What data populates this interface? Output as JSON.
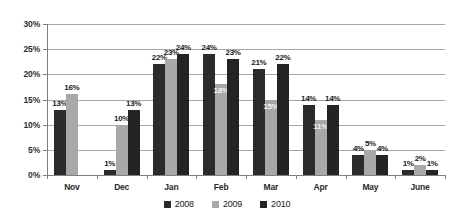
{
  "chart_data": {
    "type": "bar",
    "title": "",
    "subtitle": "",
    "xlabel": "",
    "ylabel": "",
    "categories": [
      "Nov",
      "Dec",
      "Jan",
      "Feb",
      "Mar",
      "Apr",
      "May",
      "June"
    ],
    "series": [
      {
        "name": "2008",
        "color": "#2b2b2b",
        "values": [
          13,
          1,
          22,
          24,
          21,
          14,
          4,
          1
        ],
        "labels": [
          "13%",
          "1%",
          "22%",
          "24%",
          "21%",
          "14%",
          "4%",
          "1%"
        ]
      },
      {
        "name": "2009",
        "color": "#a8a8a8",
        "values": [
          16,
          10,
          23,
          18,
          15,
          11,
          5,
          2
        ],
        "labels": [
          "16%",
          "10%",
          "23%",
          "18%",
          "15%",
          "11%",
          "5%",
          "2%"
        ]
      },
      {
        "name": "2010",
        "color": "#242424",
        "values": [
          null,
          13,
          24,
          23,
          22,
          14,
          4,
          1
        ],
        "labels": [
          "",
          "13%",
          "24%",
          "23%",
          "22%",
          "14%",
          "4%",
          "1%"
        ]
      }
    ],
    "ylim": [
      0,
      30
    ],
    "yticks": [
      0,
      5,
      10,
      15,
      20,
      25,
      30
    ],
    "ytick_labels": [
      "0%",
      "5%",
      "10%",
      "15%",
      "20%",
      "25%",
      "30%"
    ],
    "yunit": "%",
    "grid": "horizontal",
    "legend_position": "bottom",
    "data_labels": true
  },
  "legend": {
    "items": [
      {
        "label": "2008",
        "color": "#2b2b2b"
      },
      {
        "label": "2009",
        "color": "#a8a8a8"
      },
      {
        "label": "2010",
        "color": "#242424"
      }
    ]
  }
}
